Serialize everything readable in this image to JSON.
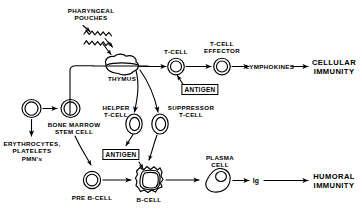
{
  "diagram": {
    "stroke_color": "#000000",
    "background_color": "#ffffff",
    "labels": {
      "pharyngeal_pouches": "PHARYNGEAL\nPOUCHES",
      "thymus": "THYMUS",
      "t_cell": "T-CELL",
      "t_cell_effector": "T-CELL\nEFFECTOR",
      "lymphokines": "LYMPHOKINES",
      "cellular_immunity": "CELLULAR\nIMMUNITY",
      "antigen_t": "ANTIGEN",
      "antigen_b": "ANTIGEN",
      "helper_t_cell": "HELPER\nT-CELL",
      "suppressor_t_cell": "SUPPRESSOR\nT-CELL",
      "bone_marrow_stem_cell": "BONE MARROW\nSTEM CELL",
      "erythrocytes": "ERYTHROCYTES,\nPLATELETS\nPMN's",
      "pre_b_cell": "PRE B-CELL",
      "b_cell": "B-CELL",
      "plasma_cell": "PLASMA\nCELL",
      "ig": "Ig",
      "humoral_immunity": "HUMORAL\nIMMUNITY"
    },
    "nodes": [
      {
        "name": "pharyngeal-pouches",
        "kind": "zigzag-pair"
      },
      {
        "name": "thymus",
        "kind": "lobed-organ"
      },
      {
        "name": "t-cell",
        "kind": "round-cell"
      },
      {
        "name": "t-cell-effector",
        "kind": "round-cell"
      },
      {
        "name": "helper-t-cell",
        "kind": "oval-cell"
      },
      {
        "name": "suppressor-t-cell",
        "kind": "oval-cell"
      },
      {
        "name": "hematopoietic-cell",
        "kind": "round-cell"
      },
      {
        "name": "bone-marrow-stem-cell",
        "kind": "round-cell"
      },
      {
        "name": "pre-b-cell",
        "kind": "round-cell"
      },
      {
        "name": "b-cell",
        "kind": "ruffled-cell"
      },
      {
        "name": "plasma-cell",
        "kind": "teardrop-cell"
      }
    ],
    "edges": [
      {
        "from": "pharyngeal-pouches",
        "to": "thymus"
      },
      {
        "from": "thymus",
        "to": "t-cell"
      },
      {
        "from": "thymus",
        "to": "helper-t-cell"
      },
      {
        "from": "thymus",
        "to": "suppressor-t-cell"
      },
      {
        "from": "antigen-t",
        "to": "t-cell"
      },
      {
        "from": "t-cell",
        "to": "t-cell-effector"
      },
      {
        "from": "t-cell-effector",
        "to": "lymphokines"
      },
      {
        "from": "lymphokines",
        "to": "cellular-immunity"
      },
      {
        "from": "hematopoietic-cell",
        "to": "bone-marrow-stem-cell"
      },
      {
        "from": "hematopoietic-cell",
        "to": "erythrocytes"
      },
      {
        "from": "bone-marrow-stem-cell",
        "to": "thymus"
      },
      {
        "from": "bone-marrow-stem-cell",
        "to": "pre-b-cell"
      },
      {
        "from": "pre-b-cell",
        "to": "b-cell"
      },
      {
        "from": "antigen-b",
        "to": "b-cell"
      },
      {
        "from": "helper-t-cell",
        "to": "b-cell"
      },
      {
        "from": "suppressor-t-cell",
        "to": "b-cell"
      },
      {
        "from": "b-cell",
        "to": "plasma-cell"
      },
      {
        "from": "plasma-cell",
        "to": "ig"
      },
      {
        "from": "ig",
        "to": "humoral-immunity"
      }
    ]
  }
}
